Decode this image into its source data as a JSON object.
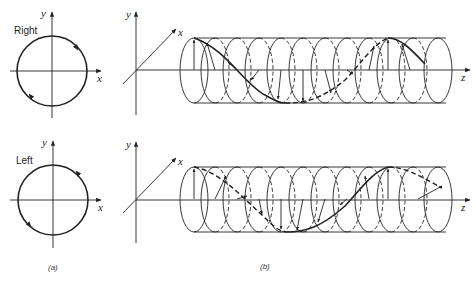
{
  "figure": {
    "panel_a": {
      "caption": "(a)",
      "top": {
        "label": "Right",
        "x_axis": "x",
        "y_axis": "y",
        "rotation": "clockwise"
      },
      "bottom": {
        "label": "Left",
        "x_axis": "x",
        "y_axis": "y",
        "rotation": "counterclockwise"
      }
    },
    "panel_b": {
      "caption": "(b)",
      "top": {
        "x_axis": "x",
        "y_axis": "y",
        "z_axis": "z",
        "description": "right circularly polarized helix"
      },
      "bottom": {
        "x_axis": "x",
        "y_axis": "y",
        "z_axis": "z",
        "description": "left circularly polarized helix"
      }
    },
    "style": {
      "ink": "#222222",
      "background": "#ffffff"
    }
  }
}
